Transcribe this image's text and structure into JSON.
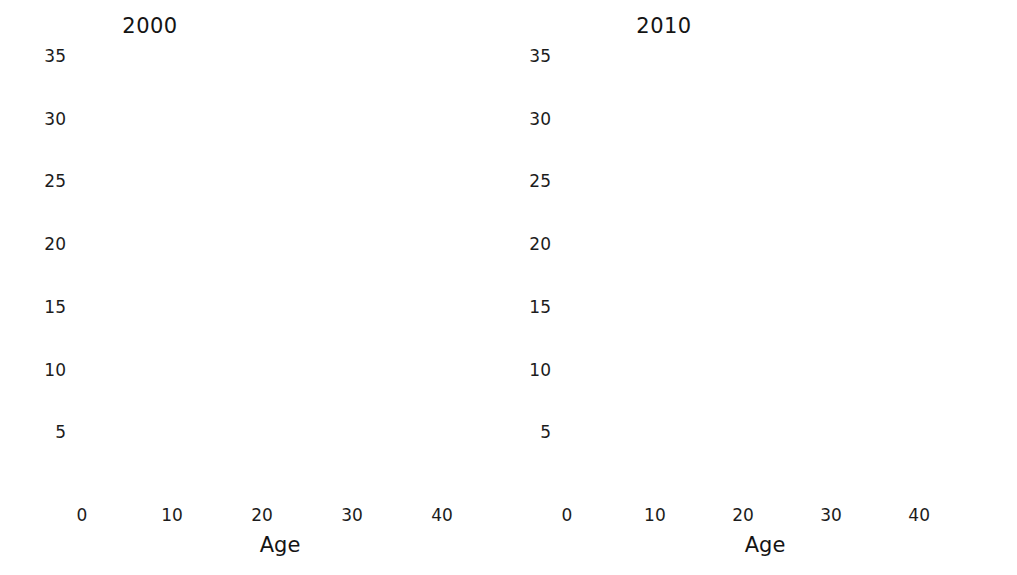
{
  "chart_data": [
    {
      "type": "bar",
      "title": "2000",
      "xlabel": "Age",
      "ylabel": "",
      "xlim": [
        -1,
        45
      ],
      "ylim": [
        0,
        35
      ],
      "grid": false,
      "legend": null,
      "xticks": [
        0,
        10,
        20,
        30,
        40
      ],
      "yticks": [
        5,
        10,
        15,
        20,
        25,
        30,
        35
      ],
      "categories": [
        0,
        1,
        2,
        3,
        4,
        5,
        6,
        7,
        8,
        9,
        10,
        11,
        12,
        13,
        14,
        15,
        16,
        17,
        18,
        19,
        20,
        21,
        22,
        23,
        24,
        25,
        26,
        27,
        28,
        29,
        30,
        31,
        32,
        33,
        34,
        35,
        36,
        37,
        38,
        39,
        40,
        41,
        42,
        43
      ],
      "values": [
        6,
        4,
        4,
        3,
        6,
        4,
        6,
        9,
        6,
        4,
        10,
        11,
        14,
        22,
        24,
        32,
        33,
        22,
        19.5,
        22,
        21.3,
        11,
        15.3,
        14.2,
        16.5,
        12.2,
        24.2,
        14.2,
        11.1,
        11.1,
        6,
        7,
        3,
        1,
        2,
        4,
        2,
        0,
        0,
        1,
        4,
        1.5,
        1.5,
        0
      ]
    },
    {
      "type": "bar",
      "title": "2010",
      "xlabel": "Age",
      "ylabel": "",
      "xlim": [
        -1,
        46
      ],
      "ylim": [
        0,
        35
      ],
      "grid": false,
      "legend": null,
      "xticks": [
        0,
        10,
        20,
        30,
        40
      ],
      "yticks": [
        5,
        10,
        15,
        20,
        25,
        30,
        35
      ],
      "categories": [
        0,
        1,
        2,
        3,
        4,
        5,
        6,
        7,
        8,
        9,
        10,
        11,
        12,
        13,
        14,
        15,
        16,
        17,
        18,
        19,
        20,
        21,
        22,
        23,
        24,
        25,
        26,
        27,
        28,
        29,
        30,
        31,
        32,
        33,
        34,
        35,
        36,
        37,
        38,
        39,
        40,
        41,
        42,
        43,
        44
      ],
      "values": [
        3,
        5,
        2,
        0,
        3,
        2,
        4,
        5,
        2,
        6,
        3,
        6,
        4,
        4,
        3,
        6,
        3.8,
        5.1,
        9.2,
        6.1,
        4.1,
        10,
        11.1,
        14.8,
        21.1,
        24.4,
        32.2,
        33,
        21,
        18.1,
        22.3,
        19.2,
        7.1,
        12.1,
        14.5,
        16.4,
        11.2,
        21.5,
        13.5,
        10.1,
        12.2,
        4.1,
        7.2,
        1,
        1.1
      ]
    }
  ]
}
